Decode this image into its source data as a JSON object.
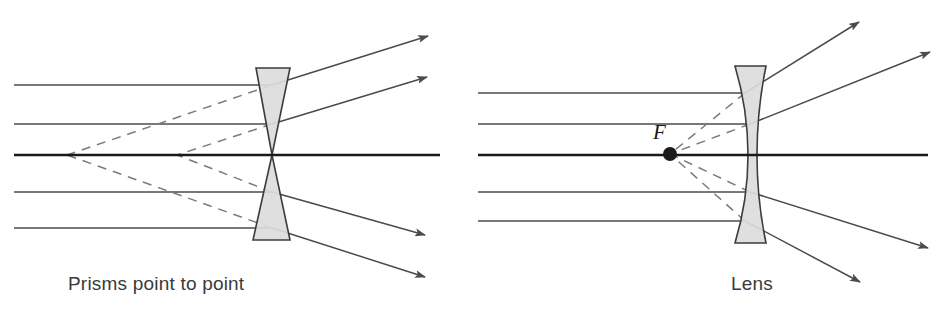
{
  "figure": {
    "background_color": "#ffffff",
    "width": 943,
    "height": 320
  },
  "style": {
    "ray_color": "#4a4a50",
    "axis_color": "#1a1a1a",
    "dashed_color": "#7a7a80",
    "glass_fill": "#dcdcdc",
    "glass_stroke": "#3c3c3c",
    "caption_color": "#3a3a3a",
    "ray_width": 1.5,
    "axis_width": 2.4,
    "dash_pattern": "9 7"
  },
  "panels": [
    {
      "id": "prisms",
      "caption": "Prisms point to point",
      "optic_kind": "two-prisms-apex-to-apex",
      "axis": {
        "y": 155,
        "x_start": 14,
        "x_end": 440
      },
      "optic": {
        "upper_prism": {
          "top_left_x": 256,
          "top_right_x": 290,
          "top_y": 68,
          "apex_x": 272,
          "apex_y": 155
        },
        "lower_prism": {
          "bottom_left_x": 253,
          "bottom_right_x": 290,
          "bottom_y": 240,
          "apex_x": 272,
          "apex_y": 155
        }
      },
      "virtual_focus_points": [
        {
          "x": 67,
          "y": 155
        },
        {
          "x": 177,
          "y": 155
        }
      ],
      "focus_marker": false,
      "incoming_rays": [
        {
          "y": 85,
          "x_start": 14,
          "x_end": 272
        },
        {
          "y": 124,
          "x_start": 14,
          "x_end": 272
        },
        {
          "y": 155,
          "x_start": 14,
          "x_end": 440,
          "is_axis": true
        },
        {
          "y": 192,
          "x_start": 14,
          "x_end": 272
        },
        {
          "y": 228,
          "x_start": 14,
          "x_end": 272
        }
      ],
      "outgoing_rays": [
        {
          "from_x": 272,
          "from_y": 85,
          "to_x": 428,
          "to_y": 36,
          "arrow": true
        },
        {
          "from_x": 272,
          "from_y": 124,
          "to_x": 427,
          "to_y": 77,
          "arrow": true
        },
        {
          "from_x": 272,
          "from_y": 192,
          "to_x": 425,
          "to_y": 235,
          "arrow": true
        },
        {
          "from_x": 272,
          "from_y": 228,
          "to_x": 425,
          "to_y": 277,
          "arrow": true
        }
      ],
      "dashed_extensions": [
        {
          "from_x": 272,
          "from_y": 85,
          "to_x": 67,
          "to_y": 155
        },
        {
          "from_x": 272,
          "from_y": 124,
          "to_x": 177,
          "to_y": 155
        },
        {
          "from_x": 272,
          "from_y": 192,
          "to_x": 177,
          "to_y": 155
        },
        {
          "from_x": 272,
          "from_y": 228,
          "to_x": 67,
          "to_y": 155
        }
      ]
    },
    {
      "id": "lens",
      "caption": "Lens",
      "optic_kind": "biconcave-diverging-lens",
      "axis": {
        "y": 155,
        "x_start": 478,
        "x_end": 928
      },
      "optic": {
        "top_y": 66,
        "bottom_y": 243,
        "top_left_x": 735,
        "top_right_x": 766,
        "bottom_left_x": 735,
        "bottom_right_x": 766,
        "waist_left_x": 748,
        "waist_right_x": 757,
        "waist_y": 155
      },
      "focus_marker": true,
      "focus_label": "F",
      "focus_point": {
        "x": 670,
        "y": 154,
        "radius": 7
      },
      "virtual_focus_points": [
        {
          "x": 670,
          "y": 154
        }
      ],
      "incoming_rays": [
        {
          "y": 93,
          "x_start": 478,
          "x_end": 745
        },
        {
          "y": 124,
          "x_start": 478,
          "x_end": 750
        },
        {
          "y": 155,
          "x_start": 478,
          "x_end": 928,
          "is_axis": true
        },
        {
          "y": 192,
          "x_start": 478,
          "x_end": 750
        },
        {
          "y": 221,
          "x_start": 478,
          "x_end": 745
        }
      ],
      "outgoing_rays": [
        {
          "from_x": 745,
          "from_y": 93,
          "to_x": 859,
          "to_y": 22,
          "arrow": true
        },
        {
          "from_x": 750,
          "from_y": 124,
          "to_x": 930,
          "to_y": 52,
          "arrow": true
        },
        {
          "from_x": 750,
          "from_y": 192,
          "to_x": 928,
          "to_y": 248,
          "arrow": true
        },
        {
          "from_x": 745,
          "from_y": 221,
          "to_x": 860,
          "to_y": 282,
          "arrow": true
        }
      ],
      "dashed_extensions": [
        {
          "from_x": 745,
          "from_y": 93,
          "to_x": 670,
          "to_y": 154
        },
        {
          "from_x": 750,
          "from_y": 124,
          "to_x": 670,
          "to_y": 154
        },
        {
          "from_x": 750,
          "from_y": 192,
          "to_x": 670,
          "to_y": 154
        },
        {
          "from_x": 745,
          "from_y": 221,
          "to_x": 670,
          "to_y": 154
        }
      ]
    }
  ]
}
